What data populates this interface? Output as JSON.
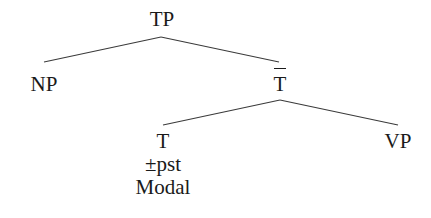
{
  "diagram": {
    "type": "syntax-tree",
    "nodes": {
      "tp": {
        "label": "TP"
      },
      "np": {
        "label": "NP"
      },
      "tbar": {
        "label": "T",
        "overline": true
      },
      "t": {
        "label": "T",
        "features": [
          "±pst",
          "Modal"
        ]
      },
      "vp": {
        "label": "VP"
      }
    },
    "edges": [
      {
        "from": "TP",
        "to": "NP"
      },
      {
        "from": "TP",
        "to": "T-bar"
      },
      {
        "from": "T-bar",
        "to": "T"
      },
      {
        "from": "T-bar",
        "to": "VP"
      }
    ],
    "line_color": "#3a3a3a"
  }
}
